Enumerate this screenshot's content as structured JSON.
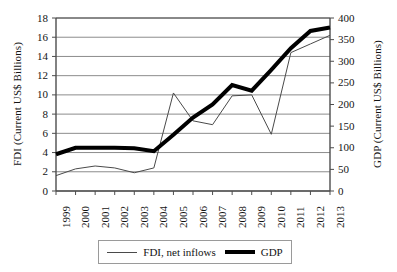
{
  "chart_data": {
    "type": "line",
    "title": "",
    "subtitle": "",
    "xlabel": "",
    "ylabel": "FDI (Current US$ Billions)",
    "y2label": "GDP (Current US$ Billions)",
    "grid": true,
    "grid_axis": "y",
    "legend_position": "bottom",
    "x": [
      1999,
      2000,
      2001,
      2002,
      2003,
      2004,
      2005,
      2006,
      2007,
      2008,
      2009,
      2010,
      2011,
      2012,
      2013
    ],
    "categories": [
      "1999",
      "2000",
      "2001",
      "2002",
      "2003",
      "2004",
      "2005",
      "2006",
      "2007",
      "2008",
      "2009",
      "2010",
      "2011",
      "2012",
      "2013"
    ],
    "ylim": [
      0,
      18
    ],
    "yticks": [
      0,
      2,
      4,
      6,
      8,
      10,
      12,
      14,
      16,
      18
    ],
    "ytick_labels": [
      "0",
      "2",
      "4",
      "6",
      "8",
      "10",
      "12",
      "14",
      "16",
      "18"
    ],
    "y2lim": [
      0,
      400
    ],
    "y2ticks": [
      0,
      50,
      100,
      150,
      200,
      250,
      300,
      350,
      400
    ],
    "y2tick_labels": [
      "0",
      "50",
      "100",
      "150",
      "200",
      "250",
      "300",
      "350",
      "400"
    ],
    "series": [
      {
        "name": "FDI, net inflows",
        "axis": "left",
        "style": "thin",
        "color": "#4a4a4a",
        "width": 1,
        "values": [
          1.6,
          2.3,
          2.6,
          2.4,
          1.9,
          2.4,
          10.2,
          7.3,
          6.9,
          9.9,
          10.0,
          5.9,
          14.4,
          15.3,
          16.2
        ]
      },
      {
        "name": "GDP",
        "axis": "right",
        "style": "thick",
        "color": "#000000",
        "width": 4,
        "values": [
          85,
          100,
          100,
          100,
          99,
          92,
          130,
          170,
          200,
          245,
          232,
          280,
          330,
          370,
          378
        ]
      }
    ],
    "legend": [
      {
        "label": "FDI, net inflows",
        "style": "thin"
      },
      {
        "label": "GDP",
        "style": "thick"
      }
    ]
  }
}
